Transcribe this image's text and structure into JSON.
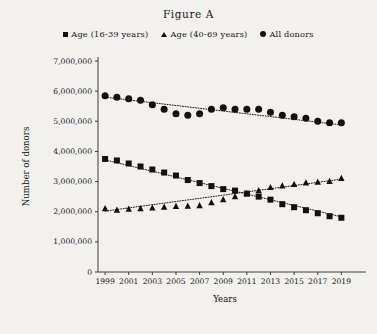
{
  "figure": {
    "title": "Figure A"
  },
  "legend": {
    "position": "top-center",
    "items": [
      {
        "marker": "square-marker",
        "label": "Age (16-39 years)"
      },
      {
        "marker": "triangle-marker",
        "label": "Age (40-69 years)"
      },
      {
        "marker": "circle-marker",
        "label": "All donors"
      }
    ]
  },
  "chart_data": {
    "type": "scatter",
    "title": "Figure A",
    "xlabel": "Years",
    "ylabel": "Number of donors",
    "xlim": [
      1998.4,
      2019.9
    ],
    "ylim": [
      0,
      7000000
    ],
    "grid": false,
    "legend_position": "top-center",
    "x_tick_labels": [
      "1999",
      "2001",
      "2003",
      "2005",
      "2007",
      "2009",
      "2011",
      "2013",
      "2015",
      "2017",
      "2019"
    ],
    "x_ticks": [
      1999,
      2001,
      2003,
      2005,
      2007,
      2009,
      2011,
      2013,
      2015,
      2017,
      2019
    ],
    "y_tick_labels": [
      "0",
      "1,000,000",
      "2,000,000",
      "3,000,000",
      "4,000,000",
      "5,000,000",
      "6,000,000",
      "7,000,000"
    ],
    "y_ticks": [
      0,
      1000000,
      2000000,
      3000000,
      4000000,
      5000000,
      6000000,
      7000000
    ],
    "x": [
      1999,
      2000,
      2001,
      2002,
      2003,
      2004,
      2005,
      2006,
      2007,
      2008,
      2009,
      2010,
      2011,
      2012,
      2013,
      2014,
      2015,
      2016,
      2017,
      2018,
      2019
    ],
    "series": [
      {
        "name": "All donors",
        "marker": "circle",
        "values": [
          5850000,
          5800000,
          5750000,
          5700000,
          5550000,
          5400000,
          5250000,
          5200000,
          5250000,
          5400000,
          5450000,
          5400000,
          5400000,
          5400000,
          5300000,
          5200000,
          5150000,
          5100000,
          5000000,
          4950000,
          4950000
        ],
        "trendline": {
          "start": 5800000,
          "end": 4880000
        }
      },
      {
        "name": "Age (16-39 years)",
        "marker": "square",
        "values": [
          3750000,
          3700000,
          3600000,
          3500000,
          3400000,
          3300000,
          3200000,
          3050000,
          2950000,
          2850000,
          2750000,
          2700000,
          2600000,
          2500000,
          2400000,
          2250000,
          2150000,
          2050000,
          1950000,
          1850000,
          1800000
        ],
        "trendline": {
          "start": 3720000,
          "end": 1830000
        }
      },
      {
        "name": "Age (40-69 years)",
        "marker": "triangle",
        "values": [
          2100000,
          2050000,
          2080000,
          2100000,
          2120000,
          2150000,
          2170000,
          2180000,
          2200000,
          2300000,
          2400000,
          2500000,
          2600000,
          2700000,
          2800000,
          2850000,
          2900000,
          2950000,
          2980000,
          3000000,
          3100000
        ],
        "trendline": {
          "start": 2020000,
          "end": 3080000
        }
      }
    ]
  }
}
